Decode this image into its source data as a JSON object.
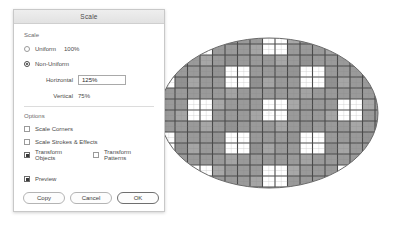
{
  "dialog": {
    "title": "Scale",
    "scale_section": {
      "label": "Scale",
      "uniform": {
        "label": "Uniform",
        "value": "100%",
        "selected": false
      },
      "non_uniform": {
        "label": "Non-Uniform",
        "selected": true
      },
      "horizontal": {
        "label": "Horizontal",
        "value": "125%"
      },
      "vertical": {
        "label": "Vertical",
        "value": "75%"
      }
    },
    "options_section": {
      "label": "Options",
      "scale_corners": {
        "label": "Scale Corners",
        "checked": false
      },
      "scale_strokes": {
        "label": "Scale Strokes & Effects",
        "checked": false
      },
      "transform_objects": {
        "label": "Transform Objects",
        "checked": true
      },
      "transform_patterns": {
        "label": "Transform Patterns",
        "checked": false
      }
    },
    "preview": {
      "label": "Preview",
      "checked": true
    },
    "buttons": {
      "copy": "Copy",
      "cancel": "Cancel",
      "ok": "OK"
    }
  },
  "artwork": {
    "shape": "ellipse",
    "center_x": 269,
    "center_y": 113,
    "radius_x": 109,
    "radius_y": 75,
    "fill_pattern": "checkerboard-grid",
    "colors": {
      "cell_gray": "#9a9a9a",
      "cell_gray_light": "#b0b0b0",
      "grid_line": "#4a4a4a",
      "white_square": "#ffffff",
      "outline": "#6a6a6a"
    },
    "grid": {
      "cell_width": 12.5,
      "cell_height": 11,
      "white_block_cols": 2,
      "white_block_rows": 2,
      "repeat_x": 75,
      "repeat_y": 66
    }
  }
}
